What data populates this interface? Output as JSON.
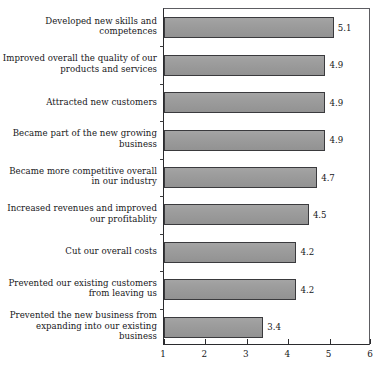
{
  "chart_data": {
    "type": "bar",
    "orientation": "horizontal",
    "title": "",
    "subtitle": "",
    "xlabel": "",
    "ylabel": "",
    "xlim": [
      1,
      6
    ],
    "xticks": [
      "1",
      "2",
      "3",
      "4",
      "5",
      "6"
    ],
    "grid": false,
    "legend": null,
    "bar_color": "#9a9a9a",
    "bar_border_color": "#3a3a3d",
    "axis_color": "#2b2b2e",
    "categories": [
      "Developed new skills and\ncompetences",
      "Improved overall the quality of our\nproducts and services",
      "Attracted new customers",
      "Became part of the new growing\nbusiness",
      "Became more competitive overall\nin our industry",
      "Increased revenues and improved\nour profitablity",
      "Cut our overall costs",
      "Prevented our existing customers\nfrom leaving us",
      "Prevented the new business from\nexpanding into our existing business"
    ],
    "values": [
      5.1,
      4.9,
      4.9,
      4.9,
      4.7,
      4.5,
      4.2,
      4.2,
      3.4
    ],
    "value_labels": [
      "5.1",
      "4.9",
      "4.9",
      "4.9",
      "4.7",
      "4.5",
      "4.2",
      "4.2",
      "3.4"
    ]
  }
}
